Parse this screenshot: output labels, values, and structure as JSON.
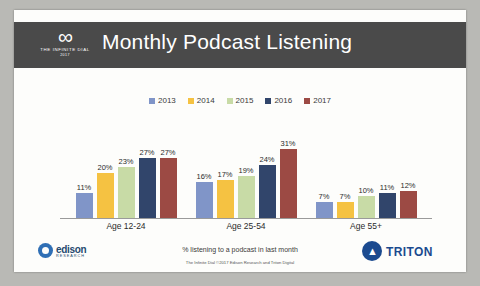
{
  "slide": {
    "title": "Monthly Podcast Listening",
    "brand_logo": {
      "glyph": "∞",
      "line1": "THE INFINITE DIAL",
      "line2": "2017"
    },
    "caption": "% listening to a podcast in last month",
    "footnote": "The Infinite Dial  ©2017 Edison Research and Triton Digital",
    "edison_logo": {
      "name": "edison",
      "sub": "RESEARCH"
    },
    "triton_logo": {
      "name": "TRITON",
      "glyph": "▲"
    }
  },
  "chart_data": {
    "type": "bar",
    "title": "Monthly Podcast Listening",
    "xlabel": "",
    "ylabel": "% listening to a podcast in last month",
    "ylim": [
      0,
      35
    ],
    "grid": false,
    "legend_position": "top-center",
    "categories": [
      "Age 12-24",
      "Age 25-54",
      "Age 55+"
    ],
    "series": [
      {
        "name": "2013",
        "color": "#8095c8",
        "values": [
          11,
          16,
          7
        ],
        "labels": [
          "11%",
          "16%",
          "7%"
        ]
      },
      {
        "name": "2014",
        "color": "#f5c242",
        "values": [
          20,
          17,
          7
        ],
        "labels": [
          "20%",
          "17%",
          "7%"
        ]
      },
      {
        "name": "2015",
        "color": "#c8dba6",
        "values": [
          23,
          19,
          10
        ],
        "labels": [
          "23%",
          "19%",
          "10%"
        ]
      },
      {
        "name": "2016",
        "color": "#31456b",
        "values": [
          27,
          24,
          11
        ],
        "labels": [
          "27%",
          "24%",
          "11%"
        ]
      },
      {
        "name": "2017",
        "color": "#9c4a44",
        "values": [
          27,
          31,
          12
        ],
        "labels": [
          "27%",
          "31%",
          "12%"
        ]
      }
    ]
  }
}
